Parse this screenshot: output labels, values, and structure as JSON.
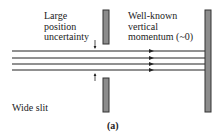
{
  "figure": {
    "left_label": {
      "lines": [
        "Large",
        "position",
        "uncertainty"
      ]
    },
    "right_label": {
      "lines": [
        "Well-known",
        "vertical",
        "momentum (~0)"
      ]
    },
    "slit_label": "Wide slit",
    "caption": "(a)"
  },
  "geometry": {
    "beam_y": [
      51,
      58,
      64,
      70
    ],
    "beam_x_start": 12,
    "beam_x_end": 205,
    "arrowhead_x": 152,
    "slit_x": 103,
    "slit_width": 6,
    "slit_top_bar": [
      10,
      44
    ],
    "slit_bottom_bar": [
      78,
      112
    ],
    "screen_x": 205,
    "screen_width": 6,
    "screen_bar": [
      10,
      112
    ]
  },
  "colors": {
    "bar_fill": "#8c8c8c",
    "bar_stroke": "#333333",
    "line": "#222222",
    "text": "#222222"
  }
}
